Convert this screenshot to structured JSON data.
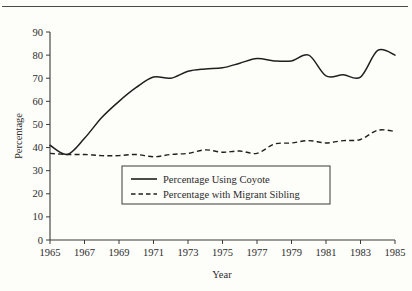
{
  "figure": {
    "background_color": "#fdfdfa",
    "line_color": "#1f1f1f",
    "axis_color": "#3a3a3a",
    "top_rule": true,
    "title_fragment": ""
  },
  "chart_data": {
    "type": "line",
    "title": "",
    "xlabel": "Year",
    "ylabel": "Percentage",
    "xlim": [
      1965,
      1985
    ],
    "ylim": [
      0,
      90
    ],
    "grid": false,
    "legend_position": "center-left-inside",
    "xticks": [
      1965,
      1967,
      1969,
      1971,
      1973,
      1975,
      1977,
      1979,
      1981,
      1983,
      1985
    ],
    "yticks": [
      0,
      10,
      20,
      30,
      40,
      50,
      60,
      70,
      80,
      90
    ],
    "x": [
      1965,
      1966,
      1967,
      1968,
      1969,
      1970,
      1971,
      1972,
      1973,
      1974,
      1975,
      1976,
      1977,
      1978,
      1979,
      1980,
      1981,
      1982,
      1983,
      1984,
      1985
    ],
    "series": [
      {
        "name": "Percentage Using Coyote",
        "style": "solid",
        "values": [
          41,
          37,
          44,
          53,
          60,
          66,
          70.5,
          70,
          73,
          74,
          74.5,
          76.5,
          78.5,
          77.5,
          77.5,
          80,
          71,
          71.5,
          70.5,
          82,
          80
        ]
      },
      {
        "name": "Percentage with Migrant Sibling",
        "style": "dashed",
        "values": [
          37.5,
          37,
          37,
          36.5,
          36.5,
          37,
          36,
          37,
          37.5,
          39,
          38,
          38.5,
          37.5,
          41.5,
          42,
          43,
          42,
          43,
          43.5,
          47.5,
          47
        ]
      }
    ]
  },
  "legend": {
    "items": [
      {
        "label": "Percentage Using Coyote",
        "style": "solid"
      },
      {
        "label": "Percentage with Migrant Sibling",
        "style": "dashed"
      }
    ]
  },
  "axis": {
    "y_title": "Percentage",
    "x_title": "Year"
  }
}
